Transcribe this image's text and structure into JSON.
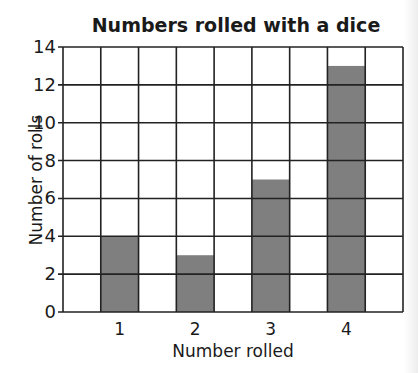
{
  "chart_data": {
    "type": "bar",
    "title": "Numbers rolled with a dice",
    "xlabel": "Number rolled",
    "ylabel": "Number of rolls",
    "categories": [
      "1",
      "2",
      "3",
      "4"
    ],
    "values": [
      4,
      3,
      7,
      13
    ],
    "ylim": [
      0,
      14
    ],
    "yticks": [
      0,
      2,
      4,
      6,
      8,
      10,
      12,
      14
    ],
    "grid": true,
    "legend": null,
    "bar_color": "#7f7f7f",
    "grid_color": "#222222"
  }
}
